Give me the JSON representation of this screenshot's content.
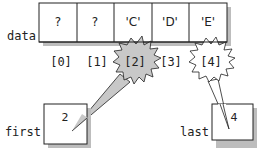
{
  "diagram": {
    "type": "array-index-pointers",
    "array": {
      "name": "data",
      "cells": [
        {
          "index_label": "[0]",
          "value": "?"
        },
        {
          "index_label": "[1]",
          "value": "?"
        },
        {
          "index_label": "[2]",
          "value": "'C'"
        },
        {
          "index_label": "[3]",
          "value": "'D'"
        },
        {
          "index_label": "[4]",
          "value": "'E'"
        }
      ]
    },
    "pointers": [
      {
        "name": "first",
        "value": "2",
        "points_to_index": 2,
        "callout_fill": "#c8c8c8"
      },
      {
        "name": "last",
        "value": "4",
        "points_to_index": 4,
        "callout_fill": "#ffffff"
      }
    ],
    "colors": {
      "stroke": "#222222",
      "shadow": "#bdbdbd",
      "callout_gray": "#c8c8c8",
      "background": "#ffffff"
    }
  }
}
